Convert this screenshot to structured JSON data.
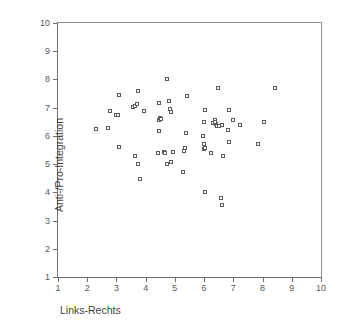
{
  "chart_data": {
    "type": "scatter",
    "title": "",
    "xlabel": "Links-Rechts",
    "ylabel": "Anti-/Pro-Integration",
    "xlim": [
      1,
      10
    ],
    "ylim": [
      1,
      10
    ],
    "xticks": [
      1,
      2,
      3,
      4,
      5,
      6,
      7,
      8,
      9,
      10
    ],
    "yticks": [
      1,
      2,
      3,
      4,
      5,
      6,
      7,
      8,
      9,
      10
    ],
    "xticklabels": [
      "1",
      "2",
      "3",
      "4",
      "5",
      "6",
      "7",
      "8",
      "9",
      "10"
    ],
    "yticklabels": [
      "1",
      "2",
      "3",
      "4",
      "5",
      "6",
      "7",
      "8",
      "9",
      "10"
    ],
    "grid": false,
    "legend": null,
    "marker": "open-square",
    "marker_color": "#5c5c5f",
    "marker_size": 4,
    "axis_color": "#6f6f72",
    "background": "#ffffff",
    "n_points": 62,
    "points": [
      [
        2.3,
        6.26
      ],
      [
        2.72,
        6.27
      ],
      [
        2.77,
        6.87
      ],
      [
        2.98,
        6.73
      ],
      [
        3.07,
        6.74
      ],
      [
        3.1,
        7.46
      ],
      [
        3.08,
        5.62
      ],
      [
        3.58,
        7.02
      ],
      [
        3.62,
        7.06
      ],
      [
        3.7,
        7.13
      ],
      [
        3.74,
        7.6
      ],
      [
        3.62,
        5.3
      ],
      [
        3.75,
        5.01
      ],
      [
        3.8,
        4.49
      ],
      [
        3.96,
        6.87
      ],
      [
        4.44,
        6.58
      ],
      [
        4.49,
        6.65
      ],
      [
        4.47,
        7.15
      ],
      [
        4.47,
        6.16
      ],
      [
        4.43,
        5.39
      ],
      [
        4.62,
        5.43
      ],
      [
        4.66,
        5.4
      ],
      [
        4.72,
        8.01
      ],
      [
        4.74,
        5.02
      ],
      [
        4.8,
        7.23
      ],
      [
        4.84,
        6.94
      ],
      [
        4.88,
        6.86
      ],
      [
        4.88,
        5.09
      ],
      [
        4.93,
        5.43
      ],
      [
        5.3,
        5.45
      ],
      [
        5.33,
        5.57
      ],
      [
        5.28,
        4.72
      ],
      [
        5.38,
        6.11
      ],
      [
        5.42,
        7.42
      ],
      [
        5.97,
        5.98
      ],
      [
        6.0,
        5.72
      ],
      [
        6.01,
        5.55
      ],
      [
        6.04,
        5.58
      ],
      [
        6.0,
        6.49
      ],
      [
        6.04,
        6.92
      ],
      [
        6.02,
        4.0
      ],
      [
        6.22,
        5.41
      ],
      [
        6.3,
        6.44
      ],
      [
        6.36,
        6.57
      ],
      [
        6.42,
        6.41
      ],
      [
        6.44,
        6.35
      ],
      [
        6.48,
        7.7
      ],
      [
        6.52,
        6.36
      ],
      [
        6.6,
        6.38
      ],
      [
        6.58,
        3.8
      ],
      [
        6.6,
        3.56
      ],
      [
        6.66,
        5.27
      ],
      [
        6.82,
        6.21
      ],
      [
        6.86,
        6.9
      ],
      [
        6.86,
        5.78
      ],
      [
        6.98,
        6.55
      ],
      [
        7.22,
        6.38
      ],
      [
        7.86,
        5.72
      ],
      [
        8.06,
        6.48
      ],
      [
        8.42,
        7.7
      ],
      [
        4.52,
        6.61
      ],
      [
        6.38,
        6.5
      ]
    ]
  }
}
